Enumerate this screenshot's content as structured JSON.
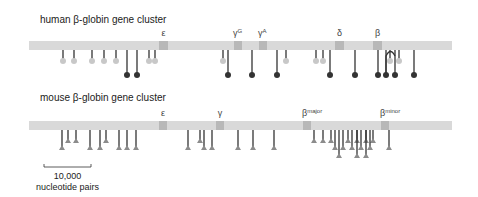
{
  "colors": {
    "bar": "#d9d9d9",
    "gene_box": "#b8b8b8",
    "stem_dark": "#333333",
    "head_dark": "#333333",
    "stem_light": "#333333",
    "head_light": "#c8c8c8",
    "triangle": "#8c8c8c"
  },
  "human": {
    "title": "human β-globin gene cluster",
    "title_x": 40,
    "title_y": 23,
    "bar": {
      "x1": 29,
      "x2": 452,
      "y": 41,
      "h": 9
    },
    "genes": [
      {
        "label": "ε",
        "sup": "",
        "x": 159,
        "w": 9
      },
      {
        "label": "γ",
        "sup": "G",
        "x": 234,
        "w": 8
      },
      {
        "label": "γ",
        "sup": "A",
        "x": 259,
        "w": 8
      },
      {
        "label": "δ",
        "sup": "",
        "x": 335,
        "w": 9
      },
      {
        "label": "β",
        "sup": "",
        "x": 373,
        "w": 9
      }
    ],
    "sites_light": [
      63,
      74,
      92,
      104,
      116,
      149,
      155,
      223,
      286,
      316,
      323,
      390,
      399
    ],
    "sites_dark": [
      127,
      137,
      228,
      252,
      277,
      330,
      355,
      378,
      386,
      395,
      414
    ],
    "arc": {
      "from": 386,
      "to": 395,
      "peak_y": 50
    }
  },
  "mouse": {
    "title": "mouse β-globin gene cluster",
    "title_x": 40,
    "title_y": 101,
    "bar": {
      "x1": 29,
      "x2": 452,
      "y": 121,
      "h": 9
    },
    "genes": [
      {
        "label": "ε",
        "sup": "",
        "x": 159,
        "w": 8
      },
      {
        "label": "γ",
        "sup": "",
        "x": 216,
        "w": 8
      },
      {
        "label": "β",
        "sup": "major",
        "x": 303,
        "w": 8
      },
      {
        "label": "β",
        "sup": "minor",
        "x": 381,
        "w": 8
      }
    ],
    "tri_short": [
      68,
      76,
      106,
      200,
      314,
      323,
      331,
      348,
      357,
      366,
      373
    ],
    "tri_long": [
      62,
      90,
      100,
      119,
      127,
      136,
      188,
      204,
      212,
      238,
      253,
      274,
      335,
      343,
      352,
      361,
      370,
      389
    ],
    "tri_longer": [
      339,
      357,
      366
    ],
    "scale_bar": {
      "x1": 44,
      "x2": 91,
      "y": 167,
      "label1": "10,000",
      "label2": "nucleotide pairs"
    }
  }
}
